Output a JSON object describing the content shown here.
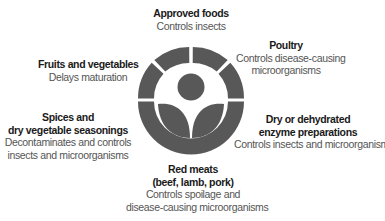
{
  "diagram": {
    "center_symbol": {
      "name": "Radura irradiation symbol",
      "color": "#585858"
    },
    "items": [
      {
        "id": "approved-foods",
        "title_lines": [
          "Approved foods"
        ],
        "desc_lines": [
          "Controls insects"
        ]
      },
      {
        "id": "poultry",
        "title_lines": [
          "Poultry"
        ],
        "desc_lines": [
          "Controls disease-causing",
          "microorganisms"
        ]
      },
      {
        "id": "fruits-vegetables",
        "title_lines": [
          "Fruits and vegetables"
        ],
        "desc_lines": [
          "Delays maturation"
        ]
      },
      {
        "id": "spices",
        "title_lines": [
          "Spices and",
          "dry vegetable seasonings"
        ],
        "desc_lines": [
          "Decontaminates and controls",
          "insects and microorganisms"
        ]
      },
      {
        "id": "enzyme-preparations",
        "title_lines": [
          "Dry or dehydrated",
          "enzyme preparations"
        ],
        "desc_lines": [
          "Controls insects and microorganisms"
        ]
      },
      {
        "id": "red-meats",
        "title_lines": [
          "Red meats",
          "(beef, lamb, pork)"
        ],
        "desc_lines": [
          "Controls spoilage and",
          "disease-causing microorganisms"
        ]
      }
    ]
  }
}
